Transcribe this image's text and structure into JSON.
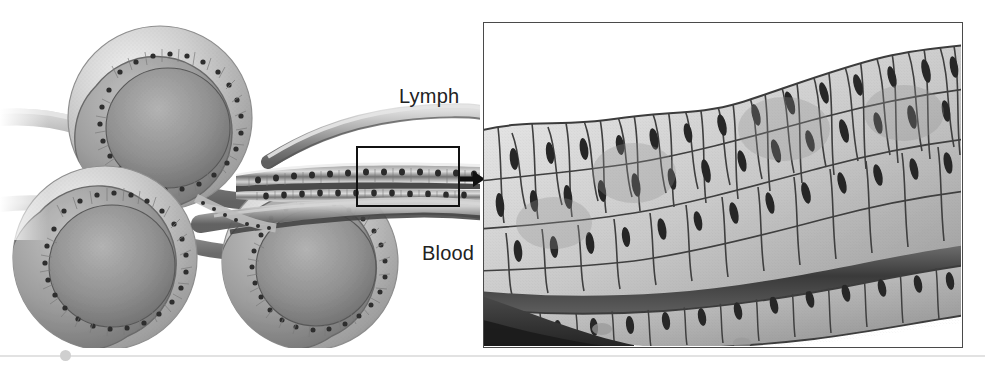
{
  "figure": {
    "background_color": "#ffffff",
    "width": 985,
    "height": 371,
    "style": "grayscale anatomical line-and-stipple illustration"
  },
  "labels": {
    "lymph": "Lymph",
    "blood": "Blood"
  },
  "overview": {
    "name": "alveoli-cluster-overview",
    "description": "Cut-away cluster of three alveolar sacs with tubular vessels; epithelial lining shown as ring of nuclei",
    "alveoli_count": 3,
    "inset_rect": {
      "x": 356,
      "y": 146,
      "width": 104,
      "height": 61
    },
    "vessels": [
      "lymph-vessel",
      "blood-vessel"
    ]
  },
  "arrow": {
    "name": "magnification-arrow",
    "direction": "right",
    "color": "#111111"
  },
  "detail_panel": {
    "name": "magnified-epithelium-panel",
    "description": "High magnification of the boxed region: stratified epithelial cells lining the lymph vessel above and the blood vessel below, separated by a dark basement membrane band",
    "border_color": "#4a4a4a",
    "x": 483,
    "y": 22,
    "width": 480,
    "height": 326
  },
  "bottom_rule": {
    "name": "footer-rule",
    "line_color": "#e2e2e2",
    "dot_color": "#cfcfcf"
  },
  "palette": {
    "ink": "#222222",
    "outline": "#3c3c3c",
    "cell_light": "#e9e9e9",
    "cell_mid": "#bdbdbd",
    "cell_dark": "#8a8a8a",
    "membrane": "#4c4c4c",
    "nucleus": "#2b2b2b"
  }
}
